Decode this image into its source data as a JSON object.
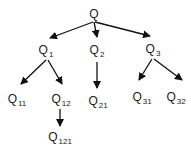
{
  "diagram": {
    "type": "tree",
    "colors": {
      "edge": "#111111",
      "text": "#1a1a1a",
      "background": "#ffffff"
    },
    "nodes": [
      {
        "id": "Q",
        "base": "Q",
        "sub": "",
        "x": 94,
        "y": 14
      },
      {
        "id": "Q1",
        "base": "Q",
        "sub": "1",
        "x": 46,
        "y": 51
      },
      {
        "id": "Q2",
        "base": "Q",
        "sub": "2",
        "x": 97,
        "y": 51
      },
      {
        "id": "Q3",
        "base": "Q",
        "sub": "3",
        "x": 153,
        "y": 50
      },
      {
        "id": "Q11",
        "base": "Q",
        "sub": "11",
        "x": 17,
        "y": 100
      },
      {
        "id": "Q12",
        "base": "Q",
        "sub": "12",
        "x": 61,
        "y": 100
      },
      {
        "id": "Q21",
        "base": "Q",
        "sub": "21",
        "x": 98,
        "y": 102
      },
      {
        "id": "Q31",
        "base": "Q",
        "sub": "31",
        "x": 142,
        "y": 98
      },
      {
        "id": "Q32",
        "base": "Q",
        "sub": "32",
        "x": 176,
        "y": 98
      },
      {
        "id": "Q121",
        "base": "Q",
        "sub": "121",
        "x": 60,
        "y": 138
      }
    ],
    "edges": [
      {
        "from": "Q",
        "to": "Q1",
        "x1": 93,
        "y1": 22,
        "x2": 50,
        "y2": 38
      },
      {
        "from": "Q",
        "to": "Q2",
        "x1": 94,
        "y1": 22,
        "x2": 97,
        "y2": 37
      },
      {
        "from": "Q",
        "to": "Q3",
        "x1": 95,
        "y1": 22,
        "x2": 150,
        "y2": 36
      },
      {
        "from": "Q1",
        "to": "Q11",
        "x1": 46,
        "y1": 60,
        "x2": 21,
        "y2": 84
      },
      {
        "from": "Q1",
        "to": "Q12",
        "x1": 48,
        "y1": 60,
        "x2": 62,
        "y2": 84
      },
      {
        "from": "Q2",
        "to": "Q21",
        "x1": 97,
        "y1": 62,
        "x2": 97,
        "y2": 88
      },
      {
        "from": "Q3",
        "to": "Q31",
        "x1": 152,
        "y1": 59,
        "x2": 139,
        "y2": 80
      },
      {
        "from": "Q3",
        "to": "Q32",
        "x1": 154,
        "y1": 59,
        "x2": 182,
        "y2": 80
      },
      {
        "from": "Q12",
        "to": "Q121",
        "x1": 60,
        "y1": 109,
        "x2": 60,
        "y2": 126
      }
    ]
  }
}
